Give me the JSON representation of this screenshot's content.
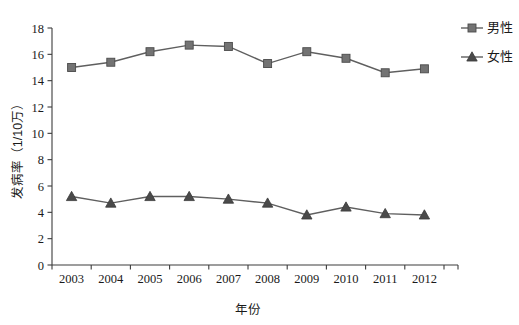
{
  "chart_data": {
    "type": "line",
    "title": "",
    "xlabel": "年份",
    "ylabel": "发病率（1/10万）",
    "categories": [
      "2003",
      "2004",
      "2005",
      "2006",
      "2007",
      "2008",
      "2009",
      "2010",
      "2011",
      "2012"
    ],
    "series": [
      {
        "name": "男性",
        "marker": "square",
        "color": "#737373",
        "values": [
          15.0,
          15.4,
          16.2,
          16.7,
          16.6,
          15.3,
          16.2,
          15.7,
          14.6,
          14.9
        ]
      },
      {
        "name": "女性",
        "marker": "triangle",
        "color": "#4a4a4a",
        "values": [
          5.2,
          4.7,
          5.2,
          5.2,
          5.0,
          4.7,
          3.8,
          4.4,
          3.9,
          3.8
        ]
      }
    ],
    "ylim": [
      0,
      18
    ],
    "yticks": [
      "0",
      "2",
      "4",
      "6",
      "8",
      "10",
      "12",
      "14",
      "16",
      "18"
    ],
    "ytick_values": [
      0,
      2,
      4,
      6,
      8,
      10,
      12,
      14,
      16,
      18
    ],
    "grid": false,
    "legend_position": "right-top"
  },
  "legend": {
    "entries": [
      {
        "label": "男性",
        "marker": "square-marker"
      },
      {
        "label": "女性",
        "marker": "triangle-marker"
      }
    ]
  },
  "axes": {
    "x_title": "年份",
    "y_title": "发病率（1/10万）"
  }
}
